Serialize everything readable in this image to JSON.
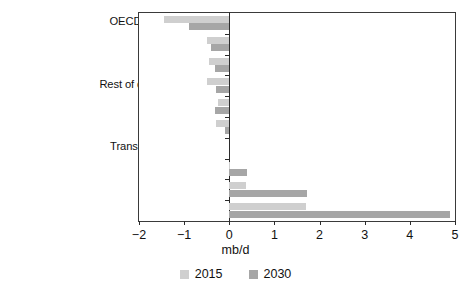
{
  "chart_data": {
    "type": "bar",
    "orientation": "horizontal",
    "title": "",
    "xlabel": "mb/d",
    "ylabel": "",
    "xlim": [
      -2,
      5
    ],
    "xticks": [
      -2,
      -1,
      0,
      1,
      2,
      3,
      4,
      5
    ],
    "xtick_labels": [
      "−2",
      "−1",
      "0",
      "1",
      "2",
      "3",
      "4",
      "5"
    ],
    "grid": false,
    "legend_position": "bottom",
    "categories": [
      "OECD North America",
      "OECD Europe",
      "OECD Pacific",
      "Rest of developing Asia",
      "Africa",
      "Latin America",
      "Transition economies",
      "Middle East",
      "India",
      "China"
    ],
    "series": [
      {
        "name": "2015",
        "color": "#cfcfcf",
        "values": [
          -1.45,
          -0.5,
          -0.45,
          -0.5,
          -0.25,
          -0.3,
          0.0,
          0.02,
          0.37,
          1.7
        ]
      },
      {
        "name": "2030",
        "color": "#a6a6a6",
        "values": [
          -0.9,
          -0.4,
          -0.32,
          -0.3,
          -0.32,
          -0.1,
          0.0,
          0.4,
          1.72,
          4.9
        ]
      }
    ]
  },
  "legend": {
    "items": [
      {
        "label": "2015",
        "color": "#cfcfcf"
      },
      {
        "label": "2030",
        "color": "#a6a6a6"
      }
    ]
  }
}
